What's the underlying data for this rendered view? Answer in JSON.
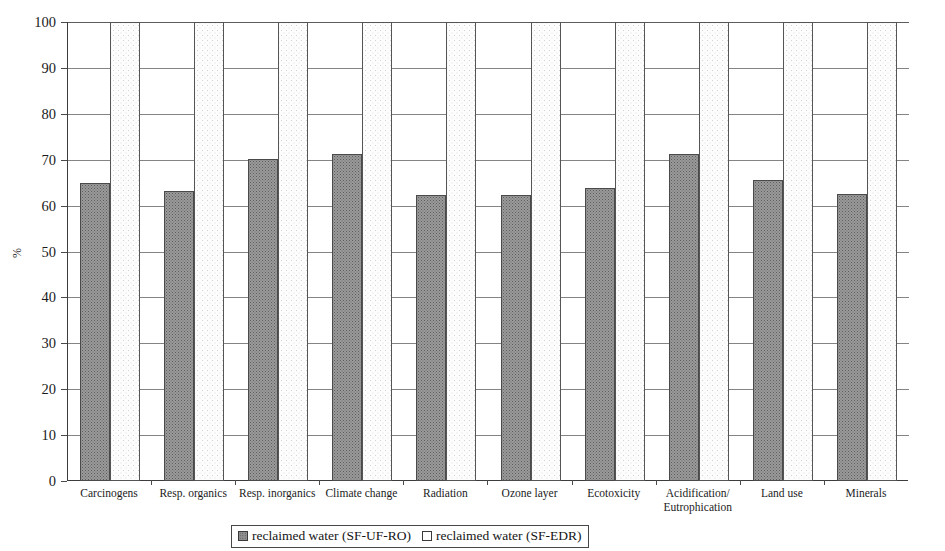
{
  "chart_data": {
    "type": "bar",
    "title": "",
    "subtitle": "",
    "xlabel": "",
    "ylabel": "%",
    "ylim": [
      0,
      100
    ],
    "ytick_step": 10,
    "yticks": [
      100,
      90,
      80,
      70,
      60,
      50,
      40,
      30,
      20,
      10,
      0
    ],
    "grid": true,
    "grid_orientation": "horizontal",
    "legend_position": "bottom-center",
    "categories": [
      "Carcinogens",
      "Resp. organics",
      "Resp. inorganics",
      "Climate change",
      "Radiation",
      "Ozone layer",
      "Ecotoxicity",
      "Acidification/ Eutrophication",
      "Land use",
      "Minerals"
    ],
    "category_lines": [
      [
        "Carcinogens"
      ],
      [
        "Resp. organics"
      ],
      [
        "Resp. inorganics"
      ],
      [
        "Climate change"
      ],
      [
        "Radiation"
      ],
      [
        "Ozone layer"
      ],
      [
        "Ecotoxicity"
      ],
      [
        "Acidification/",
        "Eutrophication"
      ],
      [
        "Land use"
      ],
      [
        "Minerals"
      ]
    ],
    "series": [
      {
        "name": "reclaimed water (SF-UF-RO)",
        "fill": "dark-stipple",
        "color": "#9a9a9a",
        "values": [
          65.0,
          63.2,
          70.1,
          71.3,
          62.4,
          62.4,
          63.8,
          71.3,
          65.5,
          62.6
        ]
      },
      {
        "name": "reclaimed water (SF-EDR)",
        "fill": "white",
        "color": "#ffffff",
        "values": [
          100,
          100,
          100,
          100,
          100,
          100,
          100,
          100,
          100,
          100
        ]
      }
    ]
  },
  "legend": {
    "items": [
      {
        "label": "reclaimed water (SF-UF-RO)",
        "swatch": "dark"
      },
      {
        "label": "reclaimed water (SF-EDR)",
        "swatch": "light"
      }
    ]
  },
  "axis": {
    "y_label": "%",
    "y_max": 100,
    "y_min": 0
  }
}
